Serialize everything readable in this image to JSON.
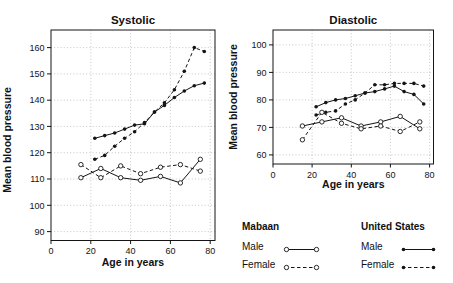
{
  "figure": {
    "background": "#ffffff",
    "line_color": "#141414",
    "grid_color": "#b8b8b8",
    "text_color": "#111111"
  },
  "legend": {
    "groups": [
      {
        "title": "Mabaan",
        "items": [
          {
            "label": "Male",
            "marker": "open",
            "dash": false
          },
          {
            "label": "Female",
            "marker": "open",
            "dash": true
          }
        ]
      },
      {
        "title": "United States",
        "items": [
          {
            "label": "Male",
            "marker": "filled",
            "dash": false
          },
          {
            "label": "Female",
            "marker": "filled",
            "dash": true
          }
        ]
      }
    ]
  },
  "chart_data": [
    {
      "type": "line",
      "title": "Systolic",
      "xlabel": "Age in years",
      "ylabel": "Mean blood pressure",
      "grid": true,
      "legend_position": "below-right",
      "xlim": [
        0,
        82.4
      ],
      "ylim": [
        86.6,
        166.7
      ],
      "xticks": [
        0,
        20,
        40,
        60,
        80
      ],
      "yticks": [
        90,
        100,
        110,
        120,
        130,
        140,
        150,
        160
      ],
      "series": [
        {
          "name": "United States Male",
          "marker": "filled",
          "dash": false,
          "x": [
            22,
            27,
            32,
            37,
            42,
            47,
            52,
            57,
            62,
            67,
            72,
            77
          ],
          "y": [
            125.5,
            126.5,
            127.5,
            129,
            130.5,
            131,
            135.5,
            138,
            141,
            143.5,
            145.5,
            146.5
          ]
        },
        {
          "name": "United States Female",
          "marker": "filled",
          "dash": true,
          "x": [
            22,
            27,
            32,
            37,
            42,
            47,
            52,
            57,
            62,
            67,
            72,
            77
          ],
          "y": [
            117.5,
            119,
            122.5,
            125.5,
            128,
            131.5,
            135.5,
            139,
            144,
            151,
            160,
            158.5
          ]
        },
        {
          "name": "Mabaan Male",
          "marker": "open",
          "dash": false,
          "x": [
            15,
            25,
            35,
            45,
            55,
            65,
            75
          ],
          "y": [
            110.5,
            114,
            110.5,
            109.5,
            111,
            108.5,
            117.5
          ]
        },
        {
          "name": "Mabaan Female",
          "marker": "open",
          "dash": true,
          "x": [
            15,
            25,
            35,
            45,
            55,
            65,
            75
          ],
          "y": [
            115.5,
            110.5,
            115,
            112,
            114.5,
            115.5,
            113
          ]
        }
      ]
    },
    {
      "type": "line",
      "title": "Diastolic",
      "xlabel": "Age in years",
      "ylabel": "Mean blood pressure",
      "grid": true,
      "xlim": [
        0,
        82
      ],
      "ylim": [
        56.7,
        105.4
      ],
      "xticks": [
        0,
        20,
        40,
        60,
        80
      ],
      "yticks": [
        60,
        70,
        80,
        90,
        100
      ],
      "series": [
        {
          "name": "United States Male",
          "marker": "filled",
          "dash": false,
          "x": [
            22,
            27,
            32,
            37,
            42,
            47,
            52,
            57,
            62,
            67,
            72,
            77
          ],
          "y": [
            77.5,
            79,
            80,
            80.5,
            81.5,
            82.5,
            83,
            84,
            85,
            83,
            82,
            78.5
          ]
        },
        {
          "name": "United States Female",
          "marker": "filled",
          "dash": true,
          "x": [
            22,
            27,
            32,
            37,
            42,
            47,
            52,
            57,
            62,
            67,
            72,
            77
          ],
          "y": [
            74.5,
            75.5,
            76,
            78.5,
            80,
            82.5,
            85.5,
            85.5,
            86,
            86,
            86,
            85
          ]
        },
        {
          "name": "Mabaan Male",
          "marker": "open",
          "dash": false,
          "x": [
            15,
            25,
            35,
            45,
            55,
            65,
            75
          ],
          "y": [
            70.5,
            72,
            73.5,
            70.5,
            72,
            74,
            69.5
          ]
        },
        {
          "name": "Mabaan Female",
          "marker": "open",
          "dash": true,
          "x": [
            15,
            25,
            35,
            45,
            55,
            65,
            75
          ],
          "y": [
            65.5,
            75.5,
            71.5,
            69.5,
            70.5,
            68.5,
            72
          ]
        }
      ]
    }
  ]
}
